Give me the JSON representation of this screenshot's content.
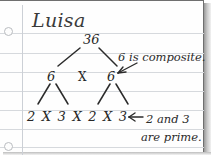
{
  "page": {
    "type": "lined-notebook-paper",
    "width": 215,
    "height": 155,
    "paper_color": "#fefefe",
    "rule_color": "#d6d9dd",
    "margin_line_color": "#ccd0d6",
    "ink_color": "#2b2b2b",
    "holes": 2
  },
  "student": {
    "name": "Luisa"
  },
  "factor_tree": {
    "root": "36",
    "level2_left": "6",
    "level2_operator": "X",
    "level2_right": "6",
    "level3": "2 X 3 X 2 X 3"
  },
  "annotations": {
    "composite_note": "6 is composite.",
    "prime_note_line1": "2 and 3",
    "prime_note_line2": "are prime."
  }
}
